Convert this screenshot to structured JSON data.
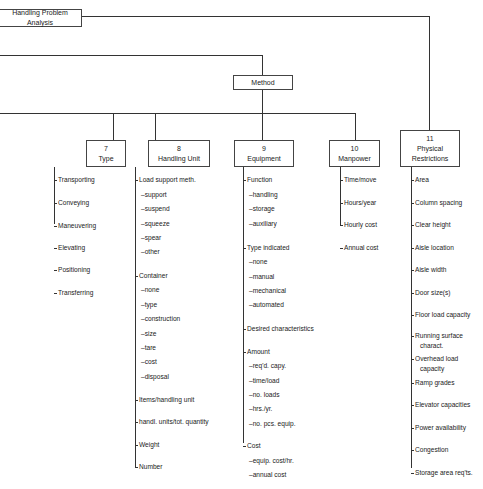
{
  "root": {
    "label": "Handling Problem Analysis"
  },
  "method": {
    "label": "Method"
  },
  "columns": [
    {
      "number": "7",
      "title": "Type",
      "items": [
        {
          "label": "Transporting",
          "level": 0
        },
        {
          "label": "Conveying",
          "level": 0
        },
        {
          "label": "Maneuvering",
          "level": 0
        },
        {
          "label": "Elevating",
          "level": 0
        },
        {
          "label": "Positioning",
          "level": 0
        },
        {
          "label": "Transferring",
          "level": 0
        }
      ]
    },
    {
      "number": "8",
      "title": "Handling Unit",
      "items": [
        {
          "label": "Load support meth.",
          "level": 0
        },
        {
          "label": "–support",
          "level": 1
        },
        {
          "label": "–suspend",
          "level": 1
        },
        {
          "label": "–squeeze",
          "level": 1
        },
        {
          "label": "–spear",
          "level": 1
        },
        {
          "label": "–other",
          "level": 1
        },
        {
          "label": "Container",
          "level": 0
        },
        {
          "label": "–none",
          "level": 1
        },
        {
          "label": "–type",
          "level": 1
        },
        {
          "label": "–construction",
          "level": 1
        },
        {
          "label": "–size",
          "level": 1
        },
        {
          "label": "–tare",
          "level": 1
        },
        {
          "label": "–cost",
          "level": 1
        },
        {
          "label": "–disposal",
          "level": 1
        },
        {
          "label": "Items/handling unit",
          "level": 0
        },
        {
          "label": "handl. units/tot. quantity",
          "level": 0
        },
        {
          "label": "Weight",
          "level": 0
        },
        {
          "label": "Number",
          "level": 0
        }
      ]
    },
    {
      "number": "9",
      "title": "Equipment",
      "items": [
        {
          "label": "Function",
          "level": 0
        },
        {
          "label": "–handling",
          "level": 1
        },
        {
          "label": "–storage",
          "level": 1
        },
        {
          "label": "–auxiliary",
          "level": 1
        },
        {
          "label": "Type indicated",
          "level": 0
        },
        {
          "label": "–none",
          "level": 1
        },
        {
          "label": "–manual",
          "level": 1
        },
        {
          "label": "–mechanical",
          "level": 1
        },
        {
          "label": "–automated",
          "level": 1
        },
        {
          "label": "Desired characteristics",
          "level": 0
        },
        {
          "label": "Amount",
          "level": 0
        },
        {
          "label": "–req'd. capy.",
          "level": 1
        },
        {
          "label": "–time/load",
          "level": 1
        },
        {
          "label": "–no. loads",
          "level": 1
        },
        {
          "label": "–hrs./yr.",
          "level": 1
        },
        {
          "label": "–no. pcs. equip.",
          "level": 1
        },
        {
          "label": "Cost",
          "level": 0
        },
        {
          "label": "–equip. cost/hr.",
          "level": 1
        },
        {
          "label": "–annual cost",
          "level": 1
        }
      ]
    },
    {
      "number": "10",
      "title": "Manpower",
      "items": [
        {
          "label": "Time/move",
          "level": 0
        },
        {
          "label": "Hours/year",
          "level": 0
        },
        {
          "label": "Hourly cost",
          "level": 0
        },
        {
          "label": "Annual cost",
          "level": 0
        }
      ]
    },
    {
      "number": "11",
      "title": "Physical Restrictions",
      "title_lines": [
        "Physical",
        "Restrictions"
      ],
      "items": [
        {
          "label": "Area",
          "level": 0
        },
        {
          "label": "Column spacing",
          "level": 0
        },
        {
          "label": "Clear height",
          "level": 0
        },
        {
          "label": "Aisle location",
          "level": 0
        },
        {
          "label": "Aisle width",
          "level": 0
        },
        {
          "label": "Door size(s)",
          "level": 0
        },
        {
          "label": "Floor load capacity",
          "level": 0
        },
        {
          "label": "Running surface",
          "level": 0
        },
        {
          "label": "charact.",
          "level": 2
        },
        {
          "label": "Overhead load",
          "level": 0
        },
        {
          "label": "capacity",
          "level": 2
        },
        {
          "label": "Ramp grades",
          "level": 0
        },
        {
          "label": "Elevator capacities",
          "level": 0
        },
        {
          "label": "Power availability",
          "level": 0
        },
        {
          "label": "Congestion",
          "level": 0
        },
        {
          "label": "Storage area req'ts.",
          "level": 0
        }
      ]
    }
  ]
}
